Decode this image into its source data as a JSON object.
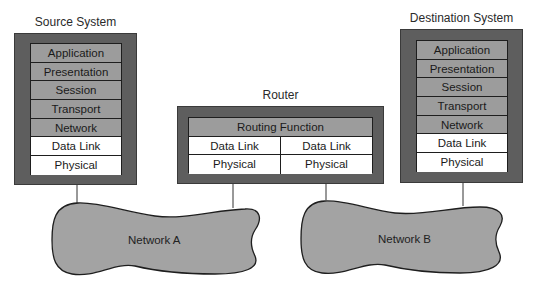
{
  "source_system": {
    "title": "Source System",
    "layers": [
      {
        "label": "Application",
        "shade": "gray"
      },
      {
        "label": "Presentation",
        "shade": "gray"
      },
      {
        "label": "Session",
        "shade": "gray"
      },
      {
        "label": "Transport",
        "shade": "gray"
      },
      {
        "label": "Network",
        "shade": "gray"
      },
      {
        "label": "Data Link",
        "shade": "white"
      },
      {
        "label": "Physical",
        "shade": "white"
      }
    ]
  },
  "router": {
    "title": "Router",
    "routing_function": "Routing Function",
    "left": {
      "data_link": "Data Link",
      "physical": "Physical"
    },
    "right": {
      "data_link": "Data Link",
      "physical": "Physical"
    }
  },
  "destination_system": {
    "title": "Destination System",
    "layers": [
      {
        "label": "Application",
        "shade": "gray"
      },
      {
        "label": "Presentation",
        "shade": "gray"
      },
      {
        "label": "Session",
        "shade": "gray"
      },
      {
        "label": "Transport",
        "shade": "gray"
      },
      {
        "label": "Network",
        "shade": "gray"
      },
      {
        "label": "Data Link",
        "shade": "white"
      },
      {
        "label": "Physical",
        "shade": "white"
      }
    ]
  },
  "networks": {
    "a": {
      "label": "Network A"
    },
    "b": {
      "label": "Network B"
    }
  },
  "colors": {
    "outer_box": "#5e5e5e",
    "upper_layers": "#9c9c9c",
    "lower_layers": "#ffffff",
    "cloud_fill": "#a3a3a3",
    "outline": "#1e1e1e"
  }
}
